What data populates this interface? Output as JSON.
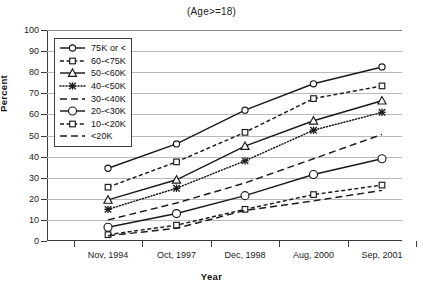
{
  "chart_data": {
    "type": "line",
    "title": "(Age>=18)",
    "xlabel": "Year",
    "ylabel": "Percent",
    "categories": [
      "Nov, 1994",
      "Oct, 1997",
      "Dec, 1998",
      "Aug, 2000",
      "Sep, 2001"
    ],
    "ylim": [
      0,
      100
    ],
    "yticks": [
      0,
      10,
      20,
      30,
      40,
      50,
      60,
      70,
      80,
      90,
      100
    ],
    "grid": "horizontal",
    "legend_position": "upper-left-inside",
    "series": [
      {
        "name": "75K or <",
        "values": [
          34.5,
          46.0,
          62.0,
          74.5,
          82.5
        ],
        "marker": "circle",
        "dash": "solid",
        "color": "#1a1a1a"
      },
      {
        "name": "60-<75K",
        "values": [
          25.5,
          37.5,
          51.5,
          67.5,
          73.5
        ],
        "marker": "square",
        "dash": "dashed-short",
        "color": "#1a1a1a"
      },
      {
        "name": "50-<60K",
        "values": [
          19.5,
          29.0,
          45.0,
          57.0,
          66.5
        ],
        "marker": "triangle",
        "dash": "solid",
        "color": "#1a1a1a"
      },
      {
        "name": "40-<50K",
        "values": [
          15.0,
          25.0,
          38.0,
          52.5,
          61.0
        ],
        "marker": "star",
        "dash": "dotted",
        "color": "#1a1a1a"
      },
      {
        "name": "30-<40K",
        "values": [
          10.0,
          18.0,
          27.5,
          39.0,
          50.5
        ],
        "marker": "none",
        "dash": "dashed-long",
        "color": "#1a1a1a"
      },
      {
        "name": "20-<30K",
        "values": [
          6.5,
          13.0,
          21.5,
          31.5,
          39.0
        ],
        "marker": "circle-large",
        "dash": "solid",
        "color": "#1a1a1a"
      },
      {
        "name": "10-<20K",
        "values": [
          3.0,
          7.5,
          15.0,
          22.0,
          26.5
        ],
        "marker": "square",
        "dash": "dashed-short",
        "color": "#1a1a1a"
      },
      {
        "name": "<20K",
        "values": [
          2.5,
          6.0,
          14.5,
          19.0,
          24.0
        ],
        "marker": "none",
        "dash": "dashed-long",
        "color": "#1a1a1a"
      }
    ]
  },
  "axis": {
    "y_tick_labels": [
      "100",
      "90",
      "80",
      "70",
      "60",
      "50",
      "40",
      "30",
      "20",
      "10",
      "0"
    ],
    "y_title": "Percent",
    "x_title": "Year",
    "x_tick_labels": [
      "Nov, 1994",
      "Oct, 1997",
      "Dec, 1998",
      "Aug, 2000",
      "Sep, 2001"
    ]
  },
  "legend": {
    "items": [
      {
        "label": "75K or <"
      },
      {
        "label": "60-<75K"
      },
      {
        "label": "50-<60K"
      },
      {
        "label": "40-<50K"
      },
      {
        "label": "30-<40K"
      },
      {
        "label": "20-<30K"
      },
      {
        "label": "10-<20K"
      },
      {
        "label": "<20K"
      }
    ]
  },
  "colors": {
    "ink": "#1a1a1a",
    "grid": "#b9b9b9",
    "axis": "#3a3a3a",
    "background": "#ffffff"
  }
}
